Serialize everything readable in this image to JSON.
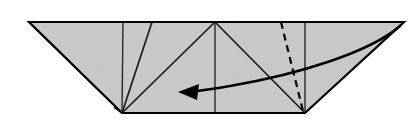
{
  "figure": {
    "type": "origami-fold-diagram",
    "background_color": "#ffffff",
    "paper_fill_color": "#c9c9c9",
    "line_color": "#000000",
    "canvas": {
      "width": 419,
      "height": 133
    }
  },
  "geometry": {
    "outline_label": "paper-outline",
    "outline_points": "29,22 404,22 305,113 122,113",
    "corners": {
      "top_left": {
        "x": 29,
        "y": 22
      },
      "top_right": {
        "x": 404,
        "y": 22
      },
      "bottom_right": {
        "x": 305,
        "y": 113
      },
      "bottom_left": {
        "x": 122,
        "y": 113
      }
    },
    "creases": [
      {
        "name": "vertical-crease-left",
        "x1": 123,
        "y1": 22,
        "x2": 122,
        "y2": 113
      },
      {
        "name": "vertical-crease-center",
        "x1": 215,
        "y1": 22,
        "x2": 215,
        "y2": 113
      },
      {
        "name": "vertical-crease-right",
        "x1": 305,
        "y1": 22,
        "x2": 305,
        "y2": 113
      },
      {
        "name": "slant-crease-left",
        "x1": 152,
        "y1": 22,
        "x2": 122,
        "y2": 113
      },
      {
        "name": "diagonal-left-to-apex",
        "x1": 122,
        "y1": 113,
        "x2": 215,
        "y2": 22
      },
      {
        "name": "diagonal-apex-to-right",
        "x1": 215,
        "y1": 22,
        "x2": 305,
        "y2": 113
      }
    ],
    "sliver_flap": {
      "name": "left-sliver-flap",
      "points": "29,22 122,113 115,108"
    },
    "dashed_fold": {
      "name": "valley-fold-line",
      "x1": 281,
      "y1": 22,
      "x2": 303,
      "y2": 111,
      "dash_pattern": "7 5"
    },
    "fold_arrow": {
      "name": "fold-direction-arrow",
      "path": "M 400 26 C 370 52, 300 74, 230 86 C 213 89, 198 91, 188 92",
      "head_points": "178,92 199,84 197,100",
      "direction": "right-to-left"
    }
  }
}
